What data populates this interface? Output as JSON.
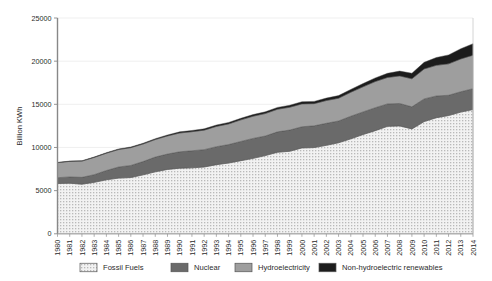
{
  "chart_data": {
    "type": "area",
    "stacked": true,
    "title": "",
    "xlabel": "",
    "ylabel": "Billion KWh",
    "ylim": [
      0,
      25000
    ],
    "ytick_labels": [
      "0",
      "5000",
      "10000",
      "15000",
      "20000",
      "25000"
    ],
    "ytick_values": [
      0,
      5000,
      10000,
      15000,
      20000,
      25000
    ],
    "grid": true,
    "grid_axis": "y",
    "legend_position": "bottom",
    "categories": [
      "1980",
      "1981",
      "1982",
      "1983",
      "1984",
      "1985",
      "1986",
      "1987",
      "1988",
      "1989",
      "1990",
      "1991",
      "1992",
      "1993",
      "1994",
      "1995",
      "1996",
      "1997",
      "1998",
      "1999",
      "2000",
      "2001",
      "2002",
      "2003",
      "2004",
      "2005",
      "2006",
      "2007",
      "2008",
      "2009",
      "2010",
      "2011",
      "2012",
      "2013",
      "2014"
    ],
    "series": [
      {
        "name": "Fossil Fuels",
        "color": "#efefef",
        "pattern": "dotted",
        "values": [
          5820,
          5860,
          5750,
          5960,
          6260,
          6450,
          6520,
          6830,
          7180,
          7460,
          7600,
          7640,
          7740,
          8010,
          8200,
          8470,
          8740,
          9060,
          9450,
          9560,
          9950,
          9990,
          10250,
          10550,
          11000,
          11500,
          11950,
          12450,
          12500,
          12150,
          13000,
          13450,
          13700,
          14100,
          14400
        ]
      },
      {
        "name": "Nuclear",
        "color": "#6a6a6a",
        "pattern": "solid",
        "values": [
          680,
          730,
          790,
          890,
          1070,
          1290,
          1400,
          1540,
          1710,
          1780,
          1900,
          1980,
          2010,
          2080,
          2140,
          2230,
          2310,
          2270,
          2360,
          2460,
          2450,
          2520,
          2550,
          2520,
          2620,
          2620,
          2660,
          2600,
          2600,
          2560,
          2630,
          2520,
          2350,
          2360,
          2410
        ]
      },
      {
        "name": "Hydroelectricity",
        "color": "#9e9e9e",
        "pattern": "solid",
        "values": [
          1740,
          1800,
          1880,
          2000,
          2010,
          2020,
          2060,
          2030,
          2030,
          2100,
          2180,
          2210,
          2260,
          2350,
          2390,
          2500,
          2570,
          2600,
          2620,
          2640,
          2650,
          2570,
          2640,
          2640,
          2780,
          2910,
          3030,
          3060,
          3190,
          3250,
          3470,
          3550,
          3640,
          3800,
          3880
        ]
      },
      {
        "name": "Non-hydroelectric renewables",
        "color": "#1c1c1c",
        "pattern": "solid",
        "values": [
          30,
          35,
          40,
          50,
          60,
          70,
          80,
          90,
          100,
          110,
          130,
          140,
          150,
          160,
          170,
          180,
          190,
          200,
          215,
          230,
          250,
          260,
          280,
          300,
          330,
          370,
          420,
          480,
          560,
          640,
          760,
          900,
          1030,
          1180,
          1330
        ]
      }
    ]
  },
  "legend": {
    "items": [
      {
        "label": "Fossil Fuels",
        "color": "#fafafa"
      },
      {
        "label": "Nuclear",
        "color": "#6a6a6a"
      },
      {
        "label": "Hydroelectricity",
        "color": "#9e9e9e"
      },
      {
        "label": "Non-hydroelectric renewables",
        "color": "#1c1c1c"
      }
    ]
  },
  "axes": {
    "y_axis_title": "Billion KWh"
  }
}
